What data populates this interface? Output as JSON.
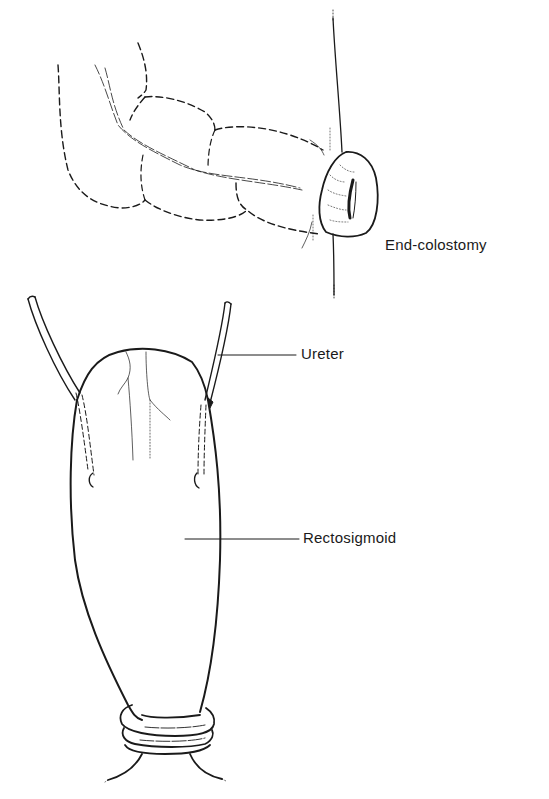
{
  "figure": {
    "panels": [
      {
        "id": "top",
        "description": "Colon brought through abdominal wall forming stoma",
        "label": "End-colostomy"
      },
      {
        "id": "bottom",
        "description": "Ureters implanted into closed rectosigmoid pouch with ring at base",
        "labels": {
          "ureter": "Ureter",
          "rectosigmoid": "Rectosigmoid"
        }
      }
    ],
    "colors": {
      "ink": "#1a1a1a",
      "background": "#ffffff"
    }
  }
}
